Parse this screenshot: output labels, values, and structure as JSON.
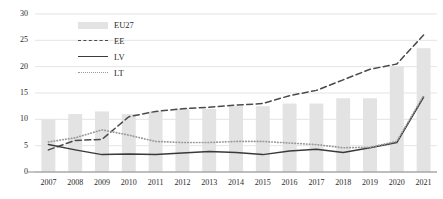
{
  "chart_data": {
    "type": "bar",
    "title": "",
    "xlabel": "",
    "ylabel": "",
    "ylim": [
      0,
      30
    ],
    "yticks": [
      0,
      5,
      10,
      15,
      20,
      25,
      30
    ],
    "grid": true,
    "legend_position": "top-left-inside",
    "categories": [
      "2007",
      "2008",
      "2009",
      "2010",
      "2011",
      "2012",
      "2013",
      "2014",
      "2015",
      "2016",
      "2017",
      "2018",
      "2019",
      "2020",
      "2021"
    ],
    "series": [
      {
        "name": "EU27",
        "type": "bar",
        "color": "#e3e3e3",
        "values": [
          10.0,
          11.0,
          11.5,
          11.0,
          11.5,
          12.0,
          12.0,
          12.5,
          12.5,
          13.0,
          13.0,
          14.0,
          14.0,
          20.0,
          23.5
        ]
      },
      {
        "name": "EE",
        "type": "line",
        "style": "dashed",
        "color": "#4a4a4a",
        "values": [
          4.2,
          6.0,
          6.2,
          10.5,
          11.5,
          12.0,
          12.3,
          12.7,
          13.0,
          14.5,
          15.5,
          17.5,
          19.5,
          20.5,
          26.0
        ]
      },
      {
        "name": "LV",
        "type": "line",
        "style": "solid",
        "color": "#3a3a3a",
        "values": [
          5.2,
          4.2,
          3.3,
          3.4,
          3.3,
          3.6,
          3.9,
          3.7,
          3.3,
          4.0,
          4.3,
          3.7,
          4.6,
          5.6,
          14.2
        ]
      },
      {
        "name": "LT",
        "type": "line",
        "style": "dotted",
        "color": "#9a9a9a",
        "values": [
          5.7,
          6.5,
          8.0,
          7.0,
          5.8,
          5.6,
          5.6,
          5.8,
          5.8,
          5.5,
          5.2,
          4.6,
          4.7,
          5.8,
          14.5
        ]
      }
    ]
  },
  "legend": {
    "items": [
      {
        "label": "EU27",
        "key": "bar-swatch"
      },
      {
        "label": "EE",
        "key": "dashed-line"
      },
      {
        "label": "LV",
        "key": "solid-line"
      },
      {
        "label": "LT",
        "key": "dotted-line"
      }
    ]
  },
  "axes": {
    "y_tick_labels": [
      "30",
      "25",
      "20",
      "15",
      "10",
      "5",
      "0"
    ],
    "x_tick_labels": [
      "2007",
      "2008",
      "2009",
      "2010",
      "2011",
      "2012",
      "2013",
      "2014",
      "2015",
      "2016",
      "2017",
      "2018",
      "2019",
      "2020",
      "2021"
    ]
  },
  "colors": {
    "bar": "#e3e3e3",
    "ee_line": "#4a4a4a",
    "lv_line": "#3a3a3a",
    "lt_line": "#9a9a9a",
    "grid": "#d8d8d8",
    "axis": "#8a8a8a",
    "text": "#2b2b2b"
  }
}
